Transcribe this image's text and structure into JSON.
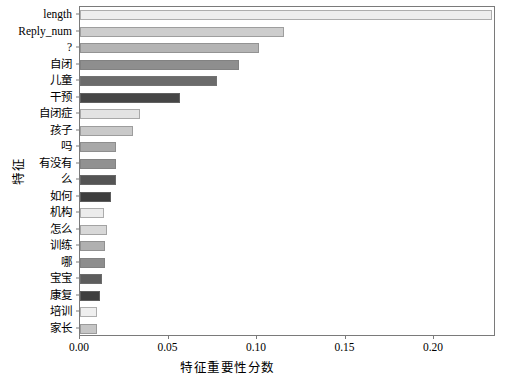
{
  "chart_data": {
    "type": "bar",
    "orientation": "horizontal",
    "title": "",
    "xlabel": "特征重要性分数",
    "ylabel": "特征",
    "xlim": [
      0.0,
      0.235
    ],
    "ylim": null,
    "grid": false,
    "legend": null,
    "xticks": [
      "0.00",
      "0.05",
      "0.10",
      "0.15",
      "0.20"
    ],
    "xtick_values": [
      0.0,
      0.05,
      0.1,
      0.15,
      0.2
    ],
    "categories": [
      "length",
      "Reply_num",
      "?",
      "自闭",
      "儿童",
      "干预",
      "自闭症",
      "孩子",
      "吗",
      "有没有",
      "么",
      "如何",
      "机构",
      "怎么",
      "训练",
      "哪",
      "宝宝",
      "康复",
      "培训",
      "家长"
    ],
    "values": [
      0.233,
      0.1152,
      0.1011,
      0.0898,
      0.0774,
      0.0565,
      0.0339,
      0.0299,
      0.0203,
      0.0203,
      0.0203,
      0.0175,
      0.0136,
      0.0153,
      0.0141,
      0.0141,
      0.0124,
      0.0113,
      0.0096,
      0.0096
    ],
    "bar_colors": [
      "#eeeeee",
      "#cdcdcd",
      "#b4b4b4",
      "#8e8e8e",
      "#6b6b6b",
      "#464646",
      "#e3e3e3",
      "#c9c9c9",
      "#a8a8a8",
      "#919191",
      "#545454",
      "#3d3d3d",
      "#ececec",
      "#d8d8d8",
      "#b0b0b0",
      "#8d8d8d",
      "#5d5d5d",
      "#3f3f3f",
      "#efefef",
      "#c6c6c6"
    ]
  }
}
